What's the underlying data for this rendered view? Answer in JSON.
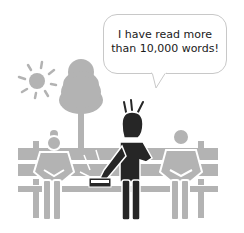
{
  "speech_bubble": {
    "line1": "I have read more",
    "line2": "than 10,000 words!"
  },
  "colors": {
    "gray": "#b3b3b3",
    "dark": "#262626",
    "bubble_border": "#c8c8c8",
    "background": "#ffffff"
  },
  "scene": {
    "elements": [
      "sun",
      "tree",
      "bench",
      "seated-person-left",
      "standing-person-center",
      "seated-person-right",
      "book"
    ]
  }
}
